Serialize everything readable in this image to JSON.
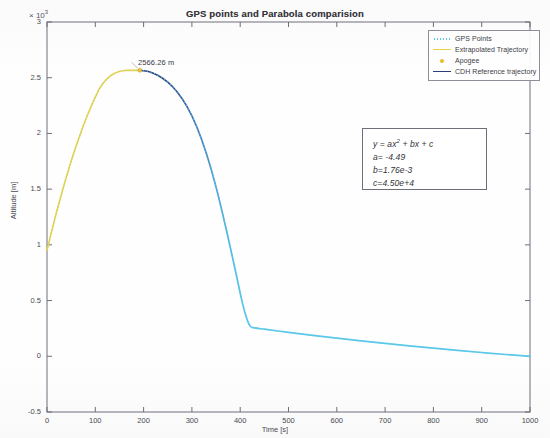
{
  "chart_data": {
    "type": "line",
    "title": "GPS points and Parabola comparision",
    "xlabel": "Time [s]",
    "ylabel": "Altitude [m]",
    "y_multiplier": "10",
    "y_multiplier_exponent": "3",
    "xlim": [
      0,
      1000
    ],
    "ylim": [
      -500,
      3000
    ],
    "xticks": [
      0,
      100,
      200,
      300,
      400,
      500,
      600,
      700,
      800,
      900,
      1000
    ],
    "xtick_labels": [
      "0",
      "100",
      "200",
      "300",
      "400",
      "500",
      "600",
      "700",
      "800",
      "900",
      "1000"
    ],
    "yticks": [
      -500,
      0,
      500,
      1000,
      1500,
      2000,
      2500,
      3000
    ],
    "ytick_labels": [
      "-0.5",
      "0",
      "0.5",
      "1",
      "1.5",
      "2",
      "2.5",
      "3"
    ],
    "grid": false,
    "legend_position": "top-right",
    "series": [
      {
        "name": "GPS Points",
        "style": "dotted",
        "color": "#5bc8e8",
        "marker": "dot"
      },
      {
        "name": "Extrapolated Trajectory",
        "style": "line",
        "color": "#e8d44a",
        "points": [
          [
            0,
            950
          ],
          [
            10,
            1128
          ],
          [
            20,
            1297
          ],
          [
            30,
            1457
          ],
          [
            40,
            1608
          ],
          [
            50,
            1750
          ],
          [
            60,
            1883
          ],
          [
            70,
            2007
          ],
          [
            80,
            2122
          ],
          [
            90,
            2228
          ],
          [
            100,
            2325
          ],
          [
            110,
            2413
          ],
          [
            120,
            2470
          ],
          [
            130,
            2512
          ],
          [
            140,
            2540
          ],
          [
            150,
            2556
          ],
          [
            160,
            2564
          ],
          [
            170,
            2566
          ],
          [
            180,
            2566
          ],
          [
            190,
            2566
          ]
        ]
      },
      {
        "name": "Apogee",
        "style": "marker",
        "color": "#e8c03a",
        "marker": "circle",
        "point": [
          192,
          2566.26
        ],
        "label": "2566.26 m"
      },
      {
        "name": "CDH Reference trajectory",
        "style": "line",
        "color": "#2b3f7a",
        "points": [
          [
            192,
            2566
          ],
          [
            210,
            2556
          ],
          [
            230,
            2520
          ],
          [
            250,
            2460
          ],
          [
            270,
            2370
          ],
          [
            290,
            2240
          ],
          [
            310,
            2060
          ],
          [
            330,
            1820
          ],
          [
            350,
            1520
          ],
          [
            370,
            1160
          ],
          [
            390,
            770
          ],
          [
            405,
            470
          ],
          [
            415,
            320
          ],
          [
            422,
            265
          ],
          [
            430,
            255
          ],
          [
            450,
            243
          ],
          [
            500,
            215
          ],
          [
            550,
            188
          ],
          [
            600,
            163
          ],
          [
            650,
            139
          ],
          [
            700,
            116
          ],
          [
            750,
            94
          ],
          [
            800,
            73
          ],
          [
            850,
            53
          ],
          [
            900,
            34
          ],
          [
            950,
            16
          ],
          [
            1000,
            0
          ]
        ]
      }
    ],
    "annotations": [
      {
        "text": "2566.26 m",
        "x": 192,
        "y": 2566.26
      }
    ],
    "equation": {
      "formula_prefix": "y = ax",
      "formula_exponent": "2",
      "formula_suffix": " + bx + c",
      "a_label": "a= -4.49",
      "b_label": "b=1.76e-3",
      "c_label": "c=4.50e+4"
    }
  },
  "legend": {
    "items": [
      {
        "label": "GPS Points",
        "color": "#5bc8e8",
        "style": "dotted"
      },
      {
        "label": "Extrapolated Trajectory",
        "color": "#e8d44a",
        "style": "line"
      },
      {
        "label": "Apogee",
        "color": "#e8c03a",
        "style": "marker"
      },
      {
        "label": "CDH Reference trajectory",
        "color": "#2b3f7a",
        "style": "line"
      }
    ]
  }
}
